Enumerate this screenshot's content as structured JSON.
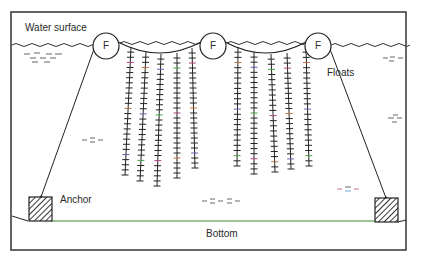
{
  "diagram": {
    "labels": {
      "water_surface": "Water surface",
      "floats": "Floats",
      "anchor": "Anchor",
      "bottom": "Bottom",
      "float_marker": "F"
    },
    "floats": [
      {
        "id": "float-left",
        "label": "F"
      },
      {
        "id": "float-center",
        "label": "F"
      },
      {
        "id": "float-right",
        "label": "F"
      }
    ],
    "anchors": [
      {
        "id": "anchor-left"
      },
      {
        "id": "anchor-right"
      }
    ],
    "hanging_line_groups": [
      {
        "id": "group-left",
        "line_count": 5
      },
      {
        "id": "group-right",
        "line_count": 5
      }
    ],
    "caption": ""
  },
  "colors": {
    "stroke": "#222222",
    "bottom_line": "#3a8a2a",
    "background": "#ffffff"
  }
}
